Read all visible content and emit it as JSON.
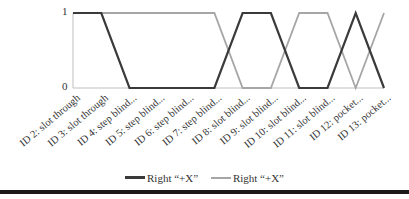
{
  "chart_data": {
    "type": "line",
    "title": "",
    "xlabel": "",
    "ylabel": "",
    "ylim": [
      0,
      1
    ],
    "yticks": [
      "0",
      "1"
    ],
    "categories": [
      "ID 2: slot through",
      "ID 3: slot through",
      "ID 4: step blind...",
      "ID 5: step blind...",
      "ID 6: step blind...",
      "ID 7: step blind...",
      "ID 8: slot blind...",
      "ID 9: slot blind...",
      "ID 10: slot blind...",
      "ID 11: slot blind...",
      "ID 12: pocket...",
      "ID 13: pocket..."
    ],
    "series": [
      {
        "name": "Right “+X”",
        "color": "#3a3a3a",
        "values": [
          1,
          1,
          0,
          0,
          0,
          0,
          1,
          1,
          0,
          0,
          1,
          0
        ]
      },
      {
        "name": "Right “+X”",
        "color": "#a6a6a6",
        "values": [
          1,
          1,
          1,
          1,
          1,
          1,
          0,
          0,
          1,
          1,
          0,
          1
        ]
      }
    ],
    "grid": false,
    "legend_position": "bottom"
  },
  "legend": {
    "items": [
      {
        "label": "Right “+X”",
        "color": "#3a3a3a"
      },
      {
        "label": "Right “+X”",
        "color": "#a6a6a6"
      }
    ]
  },
  "colors": {
    "axis": "#bfbfbf",
    "rule": "#1a1a1a"
  }
}
